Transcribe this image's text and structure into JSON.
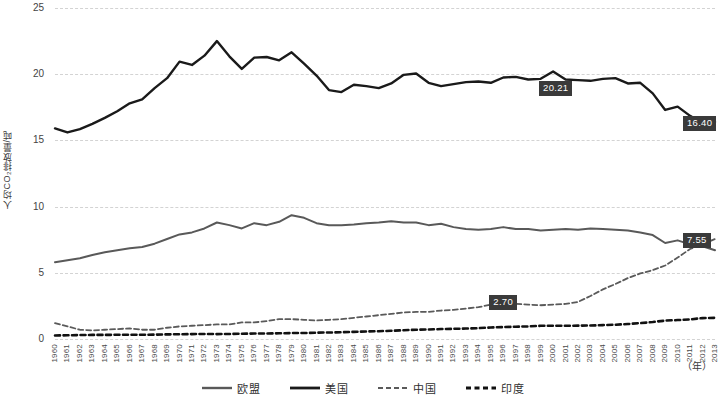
{
  "chart_data": {
    "type": "line",
    "title": "",
    "xlabel": "（年）",
    "ylabel": "人均CO₂排放量/吨",
    "ylim": [
      0,
      25
    ],
    "yticks": [
      0,
      5,
      10,
      15,
      20,
      25
    ],
    "grid": true,
    "legend_position": "bottom",
    "x": [
      1960,
      1961,
      1962,
      1963,
      1964,
      1965,
      1966,
      1967,
      1968,
      1969,
      1970,
      1971,
      1972,
      1973,
      1974,
      1975,
      1976,
      1977,
      1978,
      1979,
      1980,
      1981,
      1982,
      1983,
      1984,
      1985,
      1986,
      1987,
      1988,
      1989,
      1990,
      1991,
      1992,
      1993,
      1994,
      1995,
      1996,
      1997,
      1998,
      1999,
      2000,
      2001,
      2002,
      2003,
      2004,
      2005,
      2006,
      2007,
      2008,
      2009,
      2010,
      2011,
      2012,
      2013
    ],
    "series": [
      {
        "name": "欧盟",
        "color": "#595959",
        "style": "solid",
        "width": 2,
        "values": [
          5.8,
          5.95,
          6.1,
          6.35,
          6.55,
          6.7,
          6.85,
          6.95,
          7.2,
          7.55,
          7.9,
          8.05,
          8.35,
          8.8,
          8.6,
          8.35,
          8.75,
          8.6,
          8.85,
          9.35,
          9.15,
          8.75,
          8.6,
          8.6,
          8.65,
          8.75,
          8.8,
          8.9,
          8.8,
          8.8,
          8.6,
          8.7,
          8.45,
          8.3,
          8.25,
          8.3,
          8.45,
          8.3,
          8.3,
          8.2,
          8.25,
          8.3,
          8.25,
          8.35,
          8.3,
          8.25,
          8.2,
          8.05,
          7.85,
          7.25,
          7.45,
          7.15,
          7.0,
          6.7
        ]
      },
      {
        "name": "美国",
        "color": "#1a1a1a",
        "style": "solid",
        "width": 2.4,
        "values": [
          15.9,
          15.6,
          15.85,
          16.25,
          16.7,
          17.2,
          17.8,
          18.1,
          18.95,
          19.7,
          20.95,
          20.7,
          21.4,
          22.5,
          21.35,
          20.4,
          21.25,
          21.3,
          21.05,
          21.65,
          20.8,
          19.9,
          18.8,
          18.65,
          19.2,
          19.1,
          18.95,
          19.3,
          19.95,
          20.05,
          19.35,
          19.1,
          19.25,
          19.4,
          19.45,
          19.35,
          19.75,
          19.8,
          19.6,
          19.65,
          20.21,
          19.6,
          19.55,
          19.5,
          19.65,
          19.7,
          19.3,
          19.35,
          18.55,
          17.3,
          17.55,
          16.85,
          16.3,
          16.4
        ]
      },
      {
        "name": "中国",
        "color": "#5a5a5a",
        "style": "dashed",
        "width": 1.8,
        "values": [
          1.2,
          0.95,
          0.7,
          0.65,
          0.7,
          0.75,
          0.8,
          0.7,
          0.7,
          0.85,
          0.95,
          1.0,
          1.05,
          1.1,
          1.1,
          1.25,
          1.25,
          1.35,
          1.5,
          1.5,
          1.45,
          1.4,
          1.45,
          1.5,
          1.6,
          1.7,
          1.8,
          1.9,
          2.0,
          2.05,
          2.05,
          2.15,
          2.2,
          2.3,
          2.4,
          2.6,
          2.7,
          2.65,
          2.6,
          2.55,
          2.6,
          2.65,
          2.8,
          3.25,
          3.75,
          4.15,
          4.6,
          4.95,
          5.2,
          5.55,
          6.15,
          6.8,
          7.15,
          7.55
        ]
      },
      {
        "name": "印度",
        "color": "#111111",
        "style": "dotted",
        "width": 2.6,
        "values": [
          0.27,
          0.28,
          0.3,
          0.31,
          0.31,
          0.32,
          0.32,
          0.32,
          0.33,
          0.35,
          0.36,
          0.37,
          0.38,
          0.37,
          0.38,
          0.4,
          0.41,
          0.42,
          0.43,
          0.45,
          0.45,
          0.48,
          0.49,
          0.51,
          0.54,
          0.57,
          0.59,
          0.62,
          0.66,
          0.7,
          0.72,
          0.75,
          0.77,
          0.79,
          0.82,
          0.87,
          0.9,
          0.93,
          0.95,
          1.0,
          1.0,
          1.0,
          1.01,
          1.02,
          1.05,
          1.08,
          1.13,
          1.2,
          1.28,
          1.39,
          1.43,
          1.48,
          1.58,
          1.6
        ]
      }
    ],
    "annotations": [
      {
        "label": "20.21",
        "series": "美国",
        "year": 2000,
        "value": 20.21
      },
      {
        "label": "16.40",
        "series": "美国",
        "year": 2013,
        "value": 16.4
      },
      {
        "label": "7.55",
        "series": "中国",
        "year": 2013,
        "value": 7.55
      },
      {
        "label": "2.70",
        "series": "中国",
        "year": 1996,
        "value": 2.7
      }
    ]
  },
  "legend": {
    "items": [
      {
        "label": "欧盟"
      },
      {
        "label": "美国"
      },
      {
        "label": "中国"
      },
      {
        "label": "印度"
      }
    ]
  }
}
